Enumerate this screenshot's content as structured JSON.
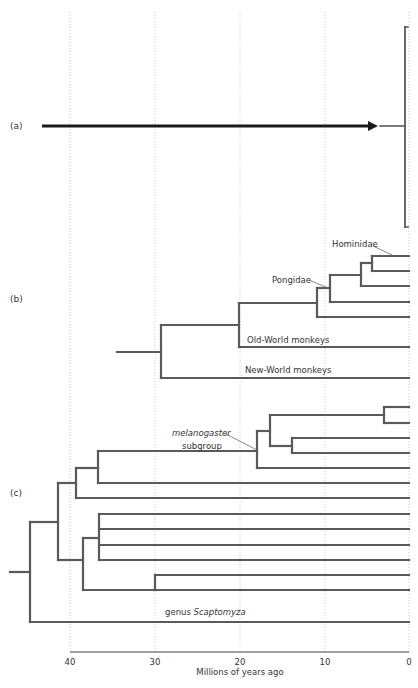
{
  "figure": {
    "panels": [
      {
        "id": "a",
        "label": "(a)",
        "x": 10,
        "y": 129
      },
      {
        "id": "b",
        "label": "(b)",
        "x": 10,
        "y": 302
      },
      {
        "id": "c",
        "label": "(c)",
        "x": 10,
        "y": 496
      }
    ],
    "axis": {
      "title": "Millions of years ago",
      "ticks": [
        {
          "label": "40",
          "x": 70
        },
        {
          "label": "30",
          "x": 155
        },
        {
          "label": "20",
          "x": 240
        },
        {
          "label": "10",
          "x": 325
        },
        {
          "label": "0",
          "x": 409
        }
      ],
      "axis_y": 652,
      "grid_top": 12
    },
    "annotations": {
      "hominidae": "Hominidae",
      "pongidae": "Pongidae",
      "old_world": "Old-World monkeys",
      "new_world": "New-World monkeys",
      "melanogaster": "melanogaster",
      "subgroup": "subgroup",
      "genus": "genus",
      "scaptomyza": "Scaptomyza"
    },
    "colors": {
      "branch": "#5a5a5a",
      "arrow": "#1a1a1a",
      "grid": "#c8c8c8",
      "text": "#333333"
    },
    "panel_a": {
      "arrow": {
        "x1": 42,
        "x2": 378,
        "y": 126
      },
      "stub": {
        "x1": 380,
        "x2": 405,
        "y": 126
      },
      "bracket": {
        "x": 405,
        "y1": 27,
        "y2": 227,
        "tick": 3
      }
    },
    "panel_b": {
      "segments": [
        [
          117,
          352,
          161,
          352
        ],
        [
          161,
          325,
          161,
          378
        ],
        [
          161,
          325,
          239,
          325
        ],
        [
          161,
          378,
          409,
          378
        ],
        [
          239,
          303,
          239,
          347
        ],
        [
          239,
          347,
          409,
          347
        ],
        [
          239,
          303,
          317,
          303
        ],
        [
          317,
          288,
          317,
          317
        ],
        [
          317,
          317,
          409,
          317
        ],
        [
          317,
          288,
          330,
          288
        ],
        [
          330,
          275,
          330,
          302
        ],
        [
          330,
          302,
          409,
          302
        ],
        [
          330,
          275,
          361,
          275
        ],
        [
          361,
          263,
          361,
          286
        ],
        [
          361,
          286,
          409,
          286
        ],
        [
          361,
          263,
          372,
          263
        ],
        [
          372,
          256,
          372,
          271
        ],
        [
          372,
          256,
          409,
          256
        ],
        [
          372,
          271,
          409,
          271
        ]
      ],
      "leaders": [
        [
          373,
          246,
          392,
          255
        ],
        [
          309,
          280,
          328,
          288
        ]
      ]
    },
    "panel_c": {
      "segments": [
        [
          10,
          572,
          30,
          572
        ],
        [
          30,
          522,
          30,
          622
        ],
        [
          30,
          622,
          409,
          622
        ],
        [
          30,
          522,
          58,
          522
        ],
        [
          58,
          483,
          58,
          560
        ],
        [
          58,
          483,
          76,
          483
        ],
        [
          58,
          560,
          83,
          560
        ],
        [
          76,
          468,
          76,
          498
        ],
        [
          76,
          498,
          409,
          498
        ],
        [
          76,
          468,
          98,
          468
        ],
        [
          98,
          451,
          98,
          483
        ],
        [
          98,
          483,
          409,
          483
        ],
        [
          98,
          451,
          257,
          451
        ],
        [
          257,
          431,
          257,
          468
        ],
        [
          257,
          468,
          409,
          468
        ],
        [
          257,
          431,
          270,
          431
        ],
        [
          270,
          415,
          270,
          446
        ],
        [
          270,
          415,
          384,
          415
        ],
        [
          270,
          446,
          292,
          446
        ],
        [
          384,
          407,
          384,
          423
        ],
        [
          384,
          407,
          409,
          407
        ],
        [
          384,
          423,
          409,
          423
        ],
        [
          292,
          438,
          292,
          453
        ],
        [
          292,
          438,
          409,
          438
        ],
        [
          292,
          453,
          409,
          453
        ],
        [
          83,
          538,
          83,
          590
        ],
        [
          83,
          538,
          99,
          538
        ],
        [
          83,
          590,
          155,
          590
        ],
        [
          99,
          514,
          99,
          560
        ],
        [
          99,
          514,
          409,
          514
        ],
        [
          99,
          529,
          409,
          529
        ],
        [
          99,
          545,
          409,
          545
        ],
        [
          99,
          560,
          409,
          560
        ],
        [
          155,
          575,
          155,
          590
        ],
        [
          155,
          575,
          409,
          575
        ],
        [
          155,
          590,
          409,
          590
        ]
      ],
      "leaders": [
        [
          224,
          433,
          257,
          450
        ]
      ]
    }
  },
  "chart_data": {
    "type": "dendrogram",
    "title": "",
    "xlabel": "Millions of years ago",
    "x_ticks": [
      40,
      30,
      20,
      10,
      0
    ],
    "xlim": [
      45,
      0
    ],
    "grid": true,
    "panels": {
      "a": "Arrow spanning ~44 to ~4 Myr pointing to a bracketed group at 0",
      "b": {
        "clades": [
          "Hominidae",
          "Pongidae",
          "Old-World monkeys",
          "New-World monkeys"
        ],
        "node_ages_myr": {
          "root": 29,
          "old_world_split": 20,
          "ape_node": 11,
          "pongidae": 9.5,
          "next": 5.7,
          "hominidae": 4.3
        }
      },
      "c": {
        "clades": [
          "melanogaster subgroup",
          "genus Scaptomyza"
        ],
        "node_ages_myr": {
          "root": 44.5,
          "n1": 41.2,
          "n2": 39.2,
          "n3": 36.6,
          "melanogaster": 17.9,
          "n5": 16.4,
          "n6": 13.8,
          "n7": 3,
          "n8": 38.4,
          "n9": 36.5,
          "n10": 30
        }
      }
    }
  }
}
